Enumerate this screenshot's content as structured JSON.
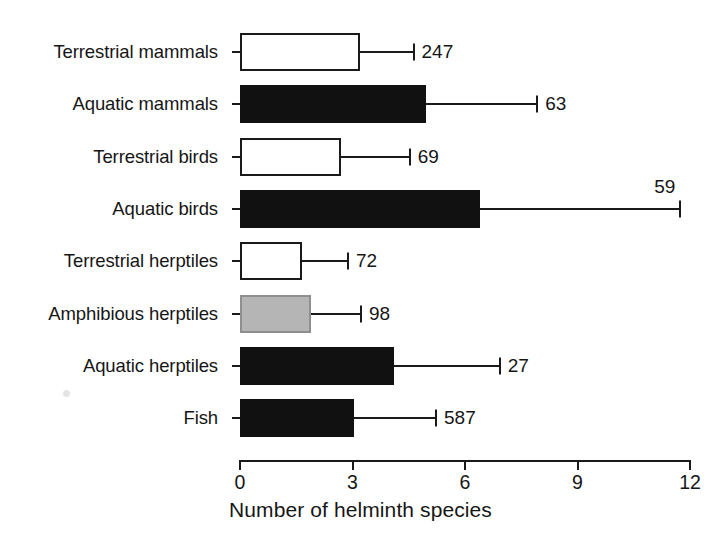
{
  "chart_data": {
    "type": "bar",
    "orientation": "horizontal",
    "title": "",
    "xlabel": "Number of helminth species",
    "ylabel": "",
    "xlim": [
      0,
      12
    ],
    "xticks": [
      0,
      3,
      6,
      9,
      12
    ],
    "xtick_labels": [
      "0",
      "3",
      "6",
      "9",
      "12"
    ],
    "grid": false,
    "legend": "none",
    "error_bars": "one-sided (upper) whisker with cap",
    "point_label_meaning": "sample size (number of host species examined)",
    "categories": [
      "Terrestrial mammals",
      "Aquatic mammals",
      "Terrestrial birds",
      "Aquatic birds",
      "Terrestrial herptiles",
      "Amphibious herptiles",
      "Aquatic herptiles",
      "Fish"
    ],
    "values": [
      3.2,
      4.95,
      2.7,
      6.4,
      1.65,
      1.9,
      4.1,
      3.05
    ],
    "errors_upper": [
      4.6,
      7.9,
      4.5,
      11.7,
      2.85,
      3.2,
      6.9,
      5.2
    ],
    "point_labels": [
      "247",
      "63",
      "69",
      "59",
      "72",
      "98",
      "27",
      "587"
    ],
    "fills": [
      "white",
      "black",
      "white",
      "black",
      "white",
      "gray",
      "black",
      "black"
    ],
    "colors": {
      "black": "#111111",
      "white": "#ffffff",
      "gray": "#b5b5b5",
      "outline": "#1a1a1a"
    },
    "bars": [
      {
        "category": "Terrestrial mammals",
        "value": 3.2,
        "error_upper": 4.6,
        "n": "247",
        "fill": "white"
      },
      {
        "category": "Aquatic mammals",
        "value": 4.95,
        "error_upper": 7.9,
        "n": "63",
        "fill": "black"
      },
      {
        "category": "Terrestrial birds",
        "value": 2.7,
        "error_upper": 4.5,
        "n": "69",
        "fill": "white"
      },
      {
        "category": "Aquatic birds",
        "value": 6.4,
        "error_upper": 11.7,
        "n": "59",
        "fill": "black"
      },
      {
        "category": "Terrestrial herptiles",
        "value": 1.65,
        "error_upper": 2.85,
        "n": "72",
        "fill": "white"
      },
      {
        "category": "Amphibious herptiles",
        "value": 1.9,
        "error_upper": 3.2,
        "n": "98",
        "fill": "gray"
      },
      {
        "category": "Aquatic herptiles",
        "value": 4.1,
        "error_upper": 6.9,
        "n": "27",
        "fill": "black"
      },
      {
        "category": "Fish",
        "value": 3.05,
        "error_upper": 5.2,
        "n": "587",
        "fill": "black"
      }
    ]
  }
}
